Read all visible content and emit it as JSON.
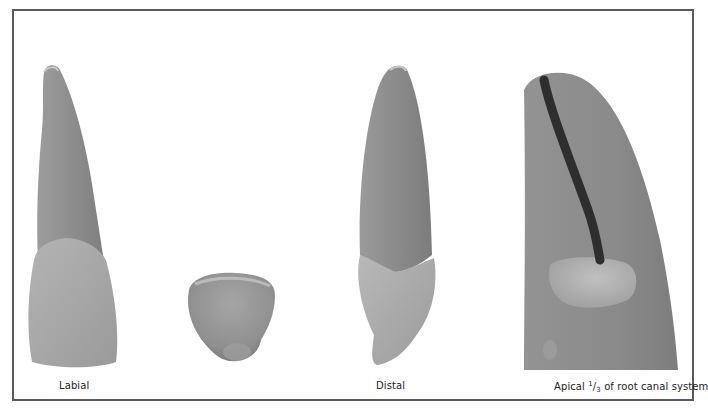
{
  "figure": {
    "panels": [
      {
        "id": "labial",
        "label": "Labial",
        "view": "labial-view-tooth"
      },
      {
        "id": "incisal",
        "label": "",
        "view": "incisal-view-tooth"
      },
      {
        "id": "distal",
        "label": "Distal",
        "view": "distal-view-tooth"
      },
      {
        "id": "apical",
        "label_prefix": "Apical",
        "fraction_num": "1",
        "fraction_sep": "/",
        "fraction_den": "3",
        "label_suffix": "of root canal system",
        "view": "root-canal-apical-view"
      }
    ],
    "colors": {
      "root": "#8f8f8f",
      "crown": "#a9a9a9",
      "canal": "#2e2e2e",
      "border": "#5a5a5a"
    }
  }
}
